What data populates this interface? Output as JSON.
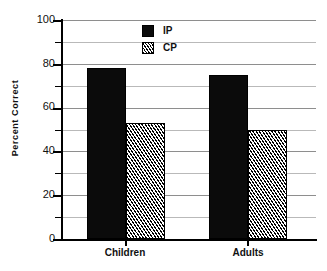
{
  "chart_data": {
    "type": "bar",
    "title": "",
    "subtitle": "",
    "xlabel": "",
    "ylabel": "Percent  Correct",
    "categories": [
      "Children",
      "Adults"
    ],
    "series": [
      {
        "name": "IP",
        "values": [
          78,
          75
        ],
        "fill": "solid",
        "color": "#0b0b0b"
      },
      {
        "name": "CP",
        "values": [
          53,
          50
        ],
        "fill": "hatch",
        "color": "#000000"
      }
    ],
    "ylim": [
      0,
      100
    ],
    "ytick_labels": [
      "0",
      "20",
      "40",
      "60",
      "80",
      "100"
    ],
    "ytick_values": [
      0,
      20,
      40,
      60,
      80,
      100
    ],
    "yminor_values": [
      10,
      30,
      50,
      70,
      90
    ],
    "grid": true,
    "grid_axis": "y",
    "legend": {
      "position": "top-center-inside",
      "entries": [
        {
          "label": "IP",
          "fill": "solid"
        },
        {
          "label": "CP",
          "fill": "hatch"
        }
      ]
    }
  },
  "axis": {
    "y_title": "Percent  Correct",
    "tick_0": "0",
    "tick_20": "20",
    "tick_40": "40",
    "tick_60": "60",
    "tick_80": "80",
    "tick_100": "100",
    "x_cat_0": "Children",
    "x_cat_1": "Adults"
  },
  "legend": {
    "entry_0": "IP",
    "entry_1": "CP"
  }
}
